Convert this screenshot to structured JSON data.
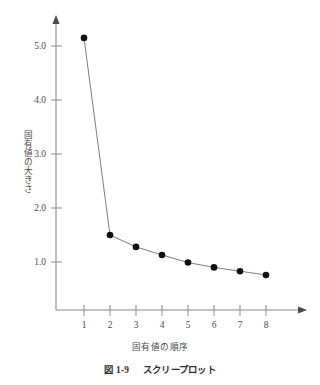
{
  "figure": {
    "caption_number": "図 1-9",
    "caption_title": "スクリープロット"
  },
  "chart_data": {
    "type": "line",
    "title": "",
    "subtitle": "",
    "xlabel": "固有値の順序",
    "ylabel": "固有値の大きさ",
    "x": [
      1,
      2,
      3,
      4,
      5,
      6,
      7,
      8
    ],
    "values": [
      5.15,
      1.5,
      1.28,
      1.13,
      0.99,
      0.9,
      0.83,
      0.76
    ],
    "series": [
      {
        "name": "固有値",
        "values": [
          5.15,
          1.5,
          1.28,
          1.13,
          0.99,
          0.9,
          0.83,
          0.76
        ]
      }
    ],
    "categories": [
      "1",
      "2",
      "3",
      "4",
      "5",
      "6",
      "7",
      "8"
    ],
    "xticklabels": [
      "1",
      "2",
      "3",
      "4",
      "5",
      "6",
      "7",
      "8"
    ],
    "yticklabels": [
      "1.0",
      "2.0",
      "3.0",
      "4.0",
      "5.0"
    ],
    "ytickvalues": [
      1.0,
      2.0,
      3.0,
      4.0,
      5.0
    ],
    "xlim": [
      0.45,
      8.6
    ],
    "ylim": [
      0.3,
      5.6
    ],
    "grid": false,
    "legend": false,
    "legend_position": "none",
    "marker": "filled-circle",
    "line_color": "#6e6e6e",
    "marker_color": "#111111",
    "axis_color": "#8a8a8a",
    "background_color": "#ffffff",
    "axis_arrows": {
      "x": "right",
      "y": "up"
    },
    "annotations": []
  }
}
